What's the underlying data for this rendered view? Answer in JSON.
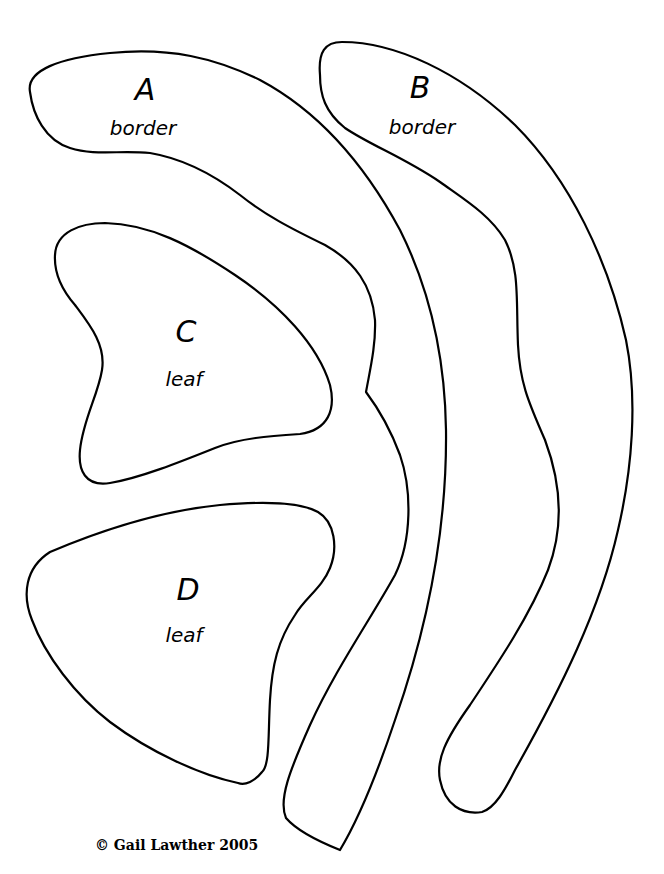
{
  "pieces": [
    {
      "id": "A",
      "letter": "A",
      "label": "border"
    },
    {
      "id": "B",
      "letter": "B",
      "label": "border"
    },
    {
      "id": "C",
      "letter": "C",
      "label": "leaf"
    },
    {
      "id": "D",
      "letter": "D",
      "label": "leaf"
    }
  ],
  "footer": {
    "copyright": "© Gail Lawther 2005"
  },
  "colors": {
    "stroke": "#000000",
    "background": "#ffffff"
  }
}
